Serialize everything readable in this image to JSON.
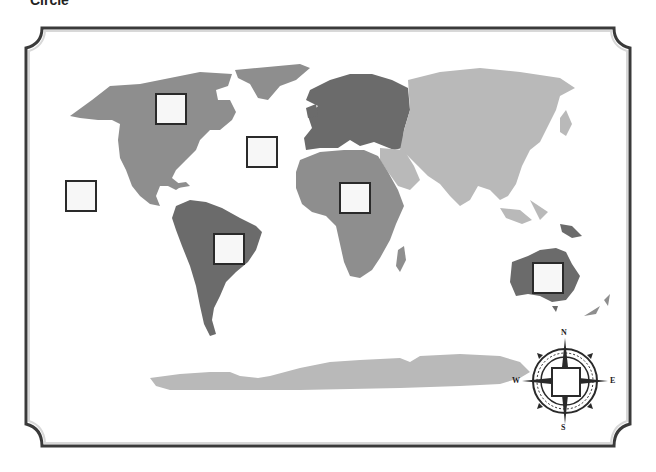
{
  "header": {
    "partial_text": "Circle"
  },
  "map": {
    "type": "world-continents-outline",
    "colors": {
      "background": "#ffffff",
      "frame": "#3a3a3a",
      "dark_gray": "#6b6b6b",
      "medium_gray": "#8e8e8e",
      "light_gray": "#b9b9b9",
      "box_border": "#2a2a2a",
      "box_fill": "#f7f7f7"
    },
    "continents": [
      {
        "name": "North America",
        "shade": "medium_gray"
      },
      {
        "name": "South America",
        "shade": "dark_gray"
      },
      {
        "name": "Europe",
        "shade": "dark_gray"
      },
      {
        "name": "Africa",
        "shade": "medium_gray"
      },
      {
        "name": "Asia",
        "shade": "light_gray"
      },
      {
        "name": "Australia",
        "shade": "dark_gray"
      },
      {
        "name": "Antarctica",
        "shade": "light_gray"
      }
    ],
    "label_boxes": [
      {
        "id": "north-america",
        "x": 155,
        "y": 93
      },
      {
        "id": "atlantic-ocean",
        "x": 246,
        "y": 136
      },
      {
        "id": "pacific-ocean",
        "x": 65,
        "y": 180
      },
      {
        "id": "africa",
        "x": 339,
        "y": 182
      },
      {
        "id": "south-america",
        "x": 213,
        "y": 233
      },
      {
        "id": "australia",
        "x": 532,
        "y": 262
      },
      {
        "id": "compass-center",
        "x": 551,
        "y": 367
      }
    ]
  },
  "compass": {
    "north": "N",
    "south": "S",
    "east": "E",
    "west": "W"
  }
}
